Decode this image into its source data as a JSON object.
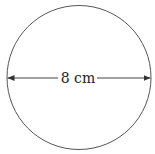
{
  "diagram": {
    "shape": "circle",
    "diameter_label": "8 cm",
    "stroke_color": "#555555",
    "text_color": "#222222",
    "background": "#ffffff"
  }
}
